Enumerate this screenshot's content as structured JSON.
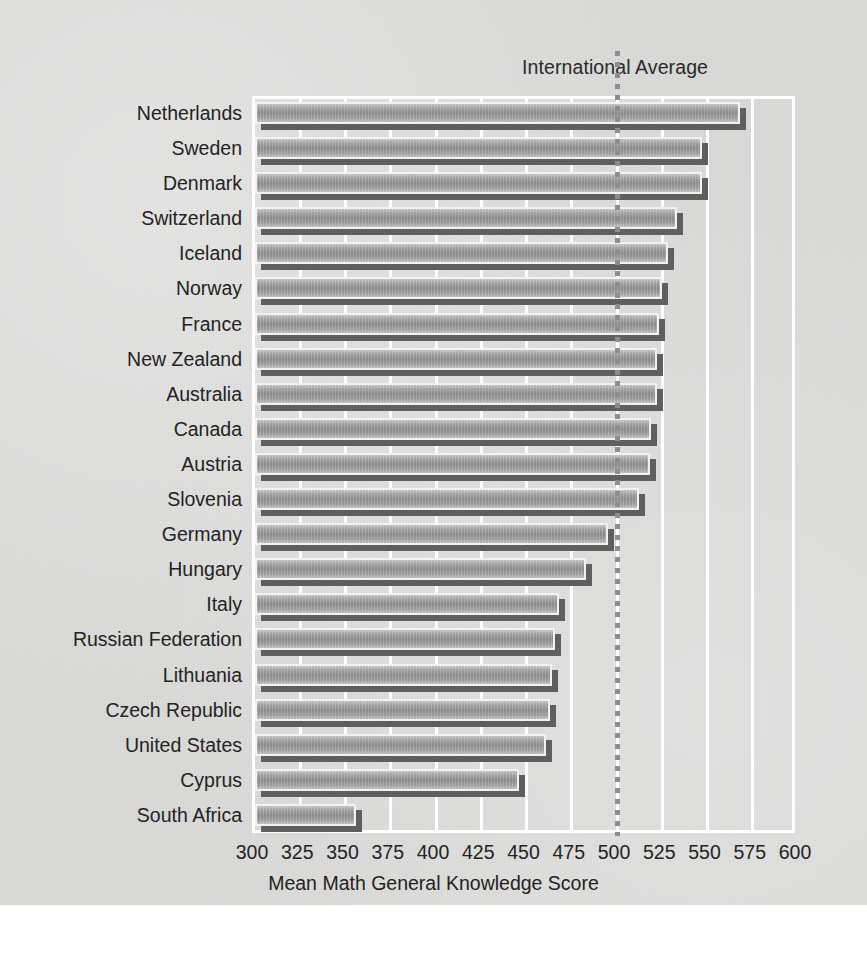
{
  "chart_data": {
    "type": "bar",
    "orientation": "horizontal",
    "title": "",
    "xlabel": "Mean Math General Knowledge Score",
    "ylabel": "",
    "xlim": [
      300,
      600
    ],
    "xticks": [
      300,
      325,
      350,
      375,
      400,
      425,
      450,
      475,
      500,
      525,
      550,
      575,
      600
    ],
    "grid": "vertical-white-gridlines",
    "legend": "none",
    "categories": [
      "Netherlands",
      "Sweden",
      "Denmark",
      "Switzerland",
      "Iceland",
      "Norway",
      "France",
      "New Zealand",
      "Australia",
      "Canada",
      "Austria",
      "Slovenia",
      "Germany",
      "Hungary",
      "Italy",
      "Russian Federation",
      "Lithuania",
      "Czech Republic",
      "United States",
      "Cyprus",
      "South Africa"
    ],
    "values": [
      568,
      547,
      547,
      533,
      528,
      525,
      523,
      522,
      522,
      519,
      518,
      512,
      495,
      483,
      468,
      466,
      464,
      463,
      461,
      446,
      356
    ],
    "annotations": [
      {
        "label": "International Average",
        "type": "vertical-reference-line",
        "value": 500,
        "style": "dotted"
      }
    ],
    "colors": {
      "background": "#d9d9d7",
      "gridline": "#ffffff",
      "bar_face": "#9a9a9a",
      "bar_shadow": "#5f5f5f",
      "text": "#232323",
      "reference_line": "#8d8d8d"
    }
  }
}
